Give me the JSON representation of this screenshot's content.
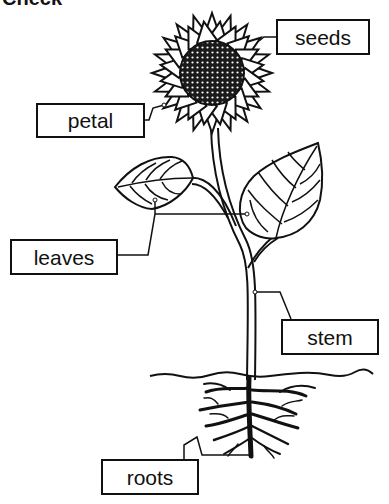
{
  "title": {
    "text": "Check"
  },
  "diagram": {
    "labels": [
      {
        "id": "seeds",
        "text": "seeds"
      },
      {
        "id": "petal",
        "text": "petal"
      },
      {
        "id": "leaves",
        "text": "leaves"
      },
      {
        "id": "stem",
        "text": "stem"
      },
      {
        "id": "roots",
        "text": "roots"
      }
    ]
  },
  "colors": {
    "ink": "#111111",
    "background": "#ffffff"
  }
}
